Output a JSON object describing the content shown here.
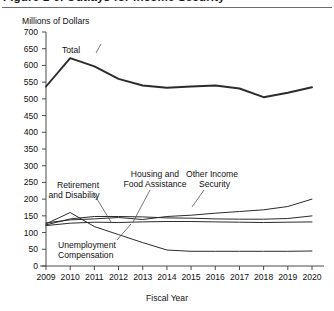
{
  "figure": {
    "title": "Figure 1-6.  Outlays for Income Security",
    "unit_label": "Millions of Dollars",
    "x_axis_title": "Fiscal Year"
  },
  "chart_data": {
    "type": "line",
    "title": "Figure 1-6.  Outlays for Income Security",
    "xlabel": "Fiscal Year",
    "ylabel": "Millions of Dollars",
    "grid": false,
    "legend_position": "inline-annotations",
    "x": [
      2009,
      2010,
      2011,
      2012,
      2013,
      2014,
      2015,
      2016,
      2017,
      2018,
      2019,
      2020
    ],
    "xtick_labels": [
      "2009",
      "2010",
      "2011",
      "2012",
      "2013",
      "2014",
      "2015",
      "2016",
      "2017",
      "2018",
      "2019",
      "2020"
    ],
    "ytick_labels": [
      "0",
      "50",
      "100",
      "150",
      "200",
      "250",
      "300",
      "350",
      "400",
      "450",
      "500",
      "550",
      "600",
      "650",
      "700"
    ],
    "ylim": [
      0,
      700
    ],
    "ytick_step": 50,
    "xlim": [
      2009,
      2020
    ],
    "series": [
      {
        "name": "Total",
        "label": "Total",
        "values": [
          537,
          622,
          597,
          560,
          540,
          533,
          537,
          540,
          531,
          505,
          518,
          535
        ]
      },
      {
        "name": "Retirement and Disability",
        "label": "Retirement and Disability",
        "values": [
          129,
          138,
          141,
          145,
          139,
          148,
          152,
          158,
          163,
          168,
          178,
          200
        ]
      },
      {
        "name": "Housing and Food Assistance",
        "label": "Housing and Food Assistance",
        "values": [
          123,
          141,
          148,
          148,
          147,
          144,
          143,
          141,
          140,
          140,
          142,
          150
        ]
      },
      {
        "name": "Other Income Security",
        "label": "Other Income Security",
        "values": [
          121,
          128,
          131,
          130,
          132,
          133,
          133,
          132,
          131,
          130,
          131,
          132
        ]
      },
      {
        "name": "Unemployment Compensation",
        "label": "Unemployment Compensation",
        "values": [
          126,
          160,
          118,
          94,
          70,
          48,
          44,
          44,
          44,
          44,
          44,
          45
        ]
      }
    ],
    "annotations": [
      {
        "text": "Total",
        "series": "Total"
      },
      {
        "text": "Retirement and Disability",
        "series": "Retirement and Disability"
      },
      {
        "text": "Housing and Food Assistance",
        "series": "Housing and Food Assistance"
      },
      {
        "text": "Other Income Security",
        "series": "Other Income Security"
      },
      {
        "text": "Unemployment Compensation",
        "series": "Unemployment Compensation"
      }
    ]
  },
  "annotations": {
    "total": "Total",
    "retirement_l1": "Retirement",
    "retirement_l2": "and Disability",
    "housing_l1": "Housing and",
    "housing_l2": "Food Assistance",
    "other_l1": "Other Income",
    "other_l2": "Security",
    "unemployment_l1": "Unemployment",
    "unemployment_l2": "Compensation"
  }
}
